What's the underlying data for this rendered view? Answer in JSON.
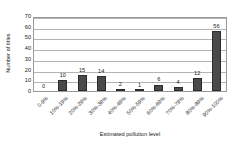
{
  "chart_data": {
    "type": "bar",
    "title": "",
    "xlabel": "Estimated pollution level",
    "ylabel": "Number of titles",
    "categories": [
      "0-9%",
      "10%-19%",
      "20%-29%",
      "30%-39%",
      "40%-49%",
      "50%-59%",
      "60%-69%",
      "70%-79%",
      "80%-89%",
      "90%-100%"
    ],
    "values": [
      0,
      10,
      15,
      14,
      2,
      1,
      6,
      4,
      12,
      56
    ],
    "value_labels": [
      "0",
      "10",
      "15",
      "14",
      "2",
      "1",
      "6",
      "4",
      "12",
      "56"
    ],
    "ylim": [
      0,
      70
    ],
    "yticks": [
      0,
      10,
      20,
      30,
      40,
      50,
      60,
      70
    ],
    "ytick_labels": [
      "0",
      "10",
      "20",
      "30",
      "40",
      "50",
      "60",
      "70"
    ],
    "grid": true,
    "legend": false,
    "bar_color": "#4a4a4a",
    "axis_color": "#9a9a9a",
    "grid_color": "#b4b4b4",
    "text_color": "#1a1a1a"
  }
}
